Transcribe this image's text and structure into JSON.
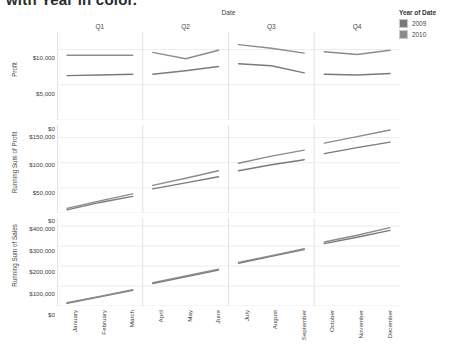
{
  "title": "with Year in color.",
  "legend": {
    "title": "Year of Date",
    "items": [
      {
        "label": "2009",
        "color": "#7a7a7a"
      },
      {
        "label": "2010",
        "color": "#8c8c8c"
      }
    ]
  },
  "column_header": "Date",
  "quarters": [
    "Q1",
    "Q2",
    "Q3",
    "Q4"
  ],
  "months": [
    "January",
    "February",
    "March",
    "April",
    "May",
    "June",
    "July",
    "August",
    "September",
    "October",
    "November",
    "December"
  ],
  "panels": [
    {
      "axis_title": "Profit",
      "ticks": [
        "$10,000",
        "$5,000",
        "$0"
      ]
    },
    {
      "axis_title": "Running Sum of Profit",
      "ticks": [
        "$150,000",
        "$100,000",
        "$50,000",
        "$0"
      ]
    },
    {
      "axis_title": "Running Sum of Sales",
      "ticks": [
        "$400,000",
        "$300,000",
        "$200,000",
        "$100,000",
        "$0"
      ]
    }
  ],
  "chart_data": {
    "type": "line",
    "title": "with Year in color.",
    "layout": "3 stacked panels (rows) x 4 quarter columns; shared x = month",
    "xlabel": "Date",
    "x": [
      "January",
      "February",
      "March",
      "April",
      "May",
      "June",
      "July",
      "August",
      "September",
      "October",
      "November",
      "December"
    ],
    "quarter_of_month": [
      "Q1",
      "Q1",
      "Q1",
      "Q2",
      "Q2",
      "Q2",
      "Q3",
      "Q3",
      "Q3",
      "Q4",
      "Q4",
      "Q4"
    ],
    "legend_title": "Year of Date",
    "legend_position": "right",
    "grid": true,
    "panels": [
      {
        "ylabel": "Profit",
        "yticks": [
          0,
          5000,
          10000
        ],
        "yticklabels": [
          "$0",
          "$5,000",
          "$10,000"
        ],
        "ylim": [
          0,
          12500
        ],
        "series": [
          {
            "name": "2009",
            "color": "#7a7a7a",
            "values": [
              6300,
              6400,
              6500,
              6500,
              7000,
              7600,
              8000,
              7700,
              6700,
              6500,
              6400,
              6600
            ]
          },
          {
            "name": "2010",
            "color": "#8c8c8c",
            "values": [
              9200,
              9200,
              9200,
              9600,
              8700,
              9900,
              10700,
              10200,
              9500,
              9700,
              9300,
              9900
            ]
          }
        ]
      },
      {
        "ylabel": "Running Sum of Profit",
        "yticks": [
          0,
          50000,
          100000,
          150000
        ],
        "yticklabels": [
          "$0",
          "$50,000",
          "$100,000",
          "$150,000"
        ],
        "ylim": [
          0,
          175000
        ],
        "series": [
          {
            "name": "2009",
            "color": "#7a7a7a",
            "values": [
              6300,
              21000,
              33000,
              48000,
              60000,
              72000,
              84000,
              96000,
              106000,
              118000,
              130000,
              141000
            ]
          },
          {
            "name": "2010",
            "color": "#8c8c8c",
            "values": [
              9200,
              24000,
              38000,
              55000,
              69000,
              84000,
              99000,
              113000,
              125000,
              139000,
              152000,
              165000
            ]
          }
        ]
      },
      {
        "ylabel": "Running Sum of Sales",
        "yticks": [
          0,
          100000,
          200000,
          300000,
          400000
        ],
        "yticklabels": [
          "$0",
          "$100,000",
          "$200,000",
          "$300,000",
          "$400,000"
        ],
        "ylim": [
          0,
          440000
        ],
        "series": [
          {
            "name": "2009",
            "color": "#7a7a7a",
            "values": [
              14000,
              46000,
              78000,
              112000,
              146000,
              180000,
              214000,
              248000,
              282000,
              312000,
              344000,
              378000
            ]
          },
          {
            "name": "2010",
            "color": "#8c8c8c",
            "values": [
              16000,
              48000,
              82000,
              116000,
              150000,
              184000,
              218000,
              252000,
              286000,
              320000,
              354000,
              392000
            ]
          }
        ]
      }
    ]
  }
}
